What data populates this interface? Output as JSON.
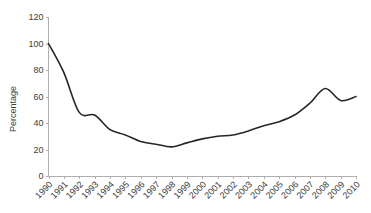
{
  "chart_data": {
    "type": "line",
    "title": "",
    "xlabel": "",
    "ylabel": "Percentage",
    "ylim": [
      0,
      120
    ],
    "ytick_values": [
      0,
      20,
      40,
      60,
      80,
      100,
      120
    ],
    "ytick_labels": [
      "0",
      "20",
      "40",
      "60",
      "80",
      "100",
      "120"
    ],
    "grid": false,
    "legend": false,
    "legend_position": "none",
    "categories": [
      "1990",
      "1991",
      "1992",
      "1993",
      "1994",
      "1995",
      "1996",
      "1997",
      "1998",
      "1999",
      "2000",
      "2001",
      "2002",
      "2003",
      "2004",
      "2005",
      "2006",
      "2007",
      "2008",
      "2009",
      "2010"
    ],
    "values": [
      100,
      78,
      48,
      46,
      35,
      31,
      26,
      24,
      22,
      25,
      28,
      30,
      31,
      34,
      38,
      41,
      46,
      55,
      66,
      57,
      60
    ],
    "series": [
      {
        "name": "Percentage",
        "color": "#262626",
        "values": [
          100,
          78,
          48,
          46,
          35,
          31,
          26,
          24,
          22,
          25,
          28,
          30,
          31,
          34,
          38,
          41,
          46,
          55,
          66,
          57,
          60
        ]
      }
    ]
  },
  "style": {
    "background": "#ffffff",
    "axis_color": "#aeaeae",
    "text_color": "#3c3c3c",
    "line_color": "#262626"
  }
}
